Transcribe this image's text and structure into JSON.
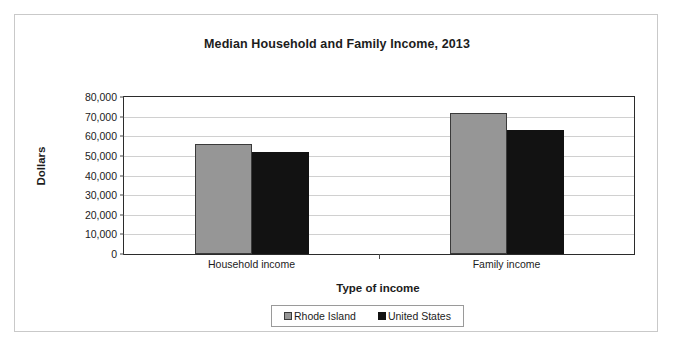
{
  "chart_data": {
    "type": "bar",
    "title": "Median Household and Family Income, 2013",
    "xlabel": "Type of income",
    "ylabel": "Dollars",
    "categories": [
      "Household income",
      "Family income"
    ],
    "series": [
      {
        "name": "Rhode Island",
        "values": [
          56000,
          72000
        ],
        "color": "#969696"
      },
      {
        "name": "United States",
        "values": [
          52000,
          63000
        ],
        "color": "#121212"
      }
    ],
    "ylim": [
      0,
      80000
    ],
    "ytick_values": [
      0,
      10000,
      20000,
      30000,
      40000,
      50000,
      60000,
      70000,
      80000
    ],
    "ytick_labels": [
      "0",
      "10,000",
      "20,000",
      "30,000",
      "40,000",
      "50,000",
      "60,000",
      "70,000",
      "80,000"
    ],
    "grid": true,
    "legend_position": "bottom"
  },
  "legend": {
    "items": [
      {
        "label": "Rhode Island",
        "color": "#969696",
        "border": "#3a3a3a"
      },
      {
        "label": "United States",
        "color": "#121212",
        "border": "#121212"
      }
    ]
  }
}
